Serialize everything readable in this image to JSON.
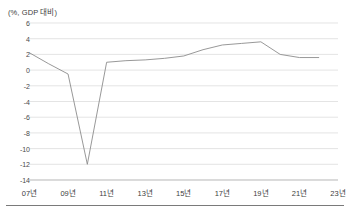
{
  "chart_data": {
    "type": "line",
    "title": "",
    "ylabel": "(%, GDP 대비)",
    "xlabel": "",
    "ylim": [
      -14,
      6
    ],
    "yticks": [
      6,
      4,
      2,
      0,
      -2,
      -4,
      -6,
      -8,
      -10,
      -12,
      -14
    ],
    "ytick_labels": [
      "6",
      "4",
      "2",
      "0",
      "-2",
      "-4",
      "-6",
      "-8",
      "-10",
      "-12",
      "-14"
    ],
    "xlim": [
      2007,
      2023
    ],
    "xticks": [
      2007,
      2009,
      2011,
      2013,
      2015,
      2017,
      2019,
      2021,
      2023
    ],
    "xtick_labels": [
      "07년",
      "09년",
      "11년",
      "13년",
      "15년",
      "17년",
      "19년",
      "21년",
      "23년"
    ],
    "grid": "horizontal",
    "legend": "none",
    "series": [
      {
        "name": "재정수지",
        "color": "#8c8c8c",
        "x": [
          2007,
          2008,
          2009,
          2010,
          2011,
          2012,
          2013,
          2014,
          2015,
          2016,
          2017,
          2018,
          2019,
          2020,
          2021,
          2022
        ],
        "values": [
          2.2,
          0.8,
          -0.5,
          -12.0,
          1.0,
          1.2,
          1.3,
          1.5,
          1.8,
          2.6,
          3.2,
          3.4,
          3.6,
          2.0,
          1.6,
          1.6
        ]
      }
    ]
  },
  "axes": {
    "axis_title_text": "(%, GDP 대비)"
  }
}
